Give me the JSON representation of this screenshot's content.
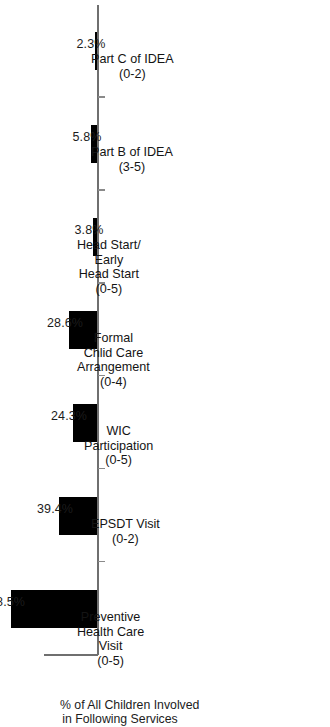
{
  "chart_data": {
    "type": "bar",
    "orientation": "vertical-printed-sideways",
    "title": "",
    "xlabel": "",
    "ylabel": "% of All Children Involved in Following Services",
    "ylabel_lines": [
      "% of All Children Involved",
      "in Following Services"
    ],
    "ylim": [
      0,
      100
    ],
    "grid": false,
    "legend": null,
    "categories": [
      "Preventive Health Care Visit (0-5)",
      "EPSDT Visit (0-2)",
      "WIC Participation (0-5)",
      "Formal Chlid Care Arrangement (0-4)",
      "Head Start/ Early Head Start (0-5)",
      "Part B of IDEA (3-5)",
      "Part C of IDEA (0-2)"
    ],
    "category_lines": [
      [
        "Preventive",
        "Health Care",
        "Visit",
        "(0-5)"
      ],
      [
        "EPSDT Visit",
        "(0-2)"
      ],
      [
        "WIC",
        "Participation",
        "(0-5)"
      ],
      [
        "Formal",
        "Chlid Care",
        "Arrangement",
        "(0-4)"
      ],
      [
        "Head Start/",
        "Early",
        "Head Start",
        "(0-5)"
      ],
      [
        "Part B of IDEA",
        "(3-5)"
      ],
      [
        "Part C of IDEA",
        "(0-2)"
      ]
    ],
    "values": [
      88.5,
      39.4,
      24.3,
      28.6,
      3.8,
      5.8,
      2.3
    ],
    "value_labels": [
      "88.5%",
      "39.4%",
      "24.3%",
      "28.6%",
      "3.8%",
      "5.8%",
      "2.3%"
    ],
    "bar_color": "#000000",
    "axis_color": "#6f6f6f"
  },
  "figure": {
    "caption": ""
  }
}
